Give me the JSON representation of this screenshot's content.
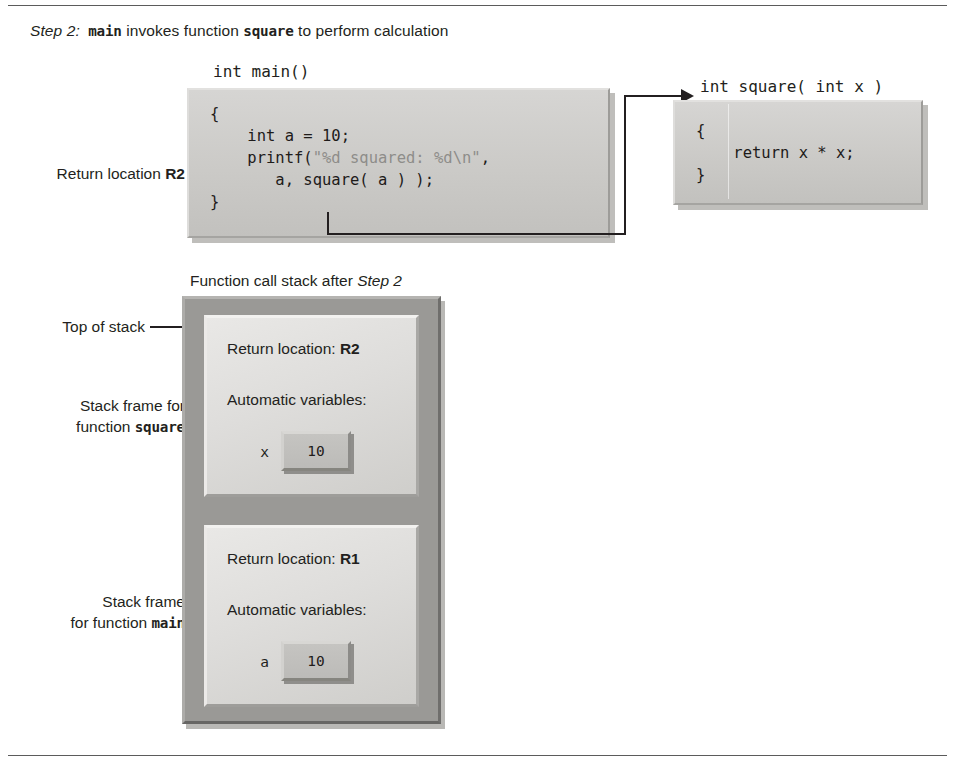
{
  "caption": {
    "step_label": "Step 2:",
    "text_before": " main",
    "rest": " invokes function ",
    "fn": "square",
    "tail": " to perform calculation",
    "plain": "Step 2: main invokes function square to perform calculation"
  },
  "code": {
    "main_header": "int main()",
    "main_body_line1": "{",
    "main_body_line2": "    int a = 10;",
    "main_body_line3_a": "    printf(",
    "main_body_line3_b": "\"%d squared: %d\\n\"",
    "main_body_line3_c": ",",
    "main_body_line4": "       a, square( a ) );",
    "main_body_line5": "}",
    "square_header": "int square( int x )",
    "square_body_line1": "{",
    "square_body_line2": "    return x * x;",
    "square_body_line3": "}"
  },
  "labels": {
    "return_location_text": "Return location ",
    "return_location_value": "R2",
    "top_of_stack": "Top of stack",
    "stack_title_before": "Function call stack after ",
    "stack_title_step": "Step 2",
    "frame_square_line1": "Stack frame for",
    "frame_square_line2_before": "function ",
    "frame_square_line2_fn": "square",
    "frame_main_line1": "Stack frame",
    "frame_main_line2_before": "for function ",
    "frame_main_line2_fn": "main"
  },
  "stack": {
    "frames": [
      {
        "name": "square",
        "return_label": "Return location: ",
        "return_value": "R2",
        "automatic_label": "Automatic variables:",
        "variable_name": "x",
        "variable_value": "10"
      },
      {
        "name": "main",
        "return_label": "Return location: ",
        "return_value": "R1",
        "automatic_label": "Automatic variables:",
        "variable_name": "a",
        "variable_value": "10"
      }
    ]
  },
  "colors": {
    "ink": "#231f20",
    "code_box": "#cbcac7",
    "stack_container": "#9a9996",
    "frame": "#dedddb",
    "var_box": "#bcbbb8"
  }
}
